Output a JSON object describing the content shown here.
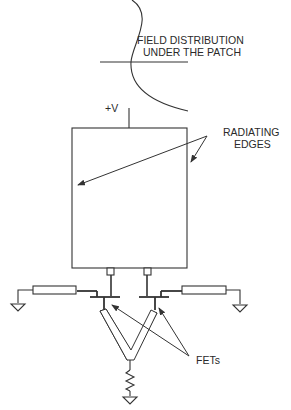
{
  "diagram": {
    "labels": {
      "field_line1": "FIELD DISTRIBUTION",
      "field_line2": "UNDER THE PATCH",
      "supply": "+V",
      "radiating_line1": "RADIATING",
      "radiating_line2": "EDGES",
      "fets": "FETs"
    },
    "colors": {
      "stroke": "#333333",
      "background": "#ffffff"
    }
  }
}
